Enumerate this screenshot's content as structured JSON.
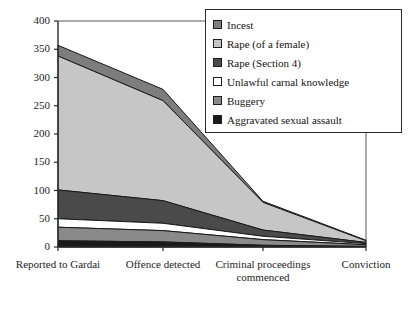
{
  "chart_data": {
    "type": "area",
    "stacked": true,
    "title": "",
    "xlabel": "",
    "ylabel": "",
    "ylim": [
      0,
      400
    ],
    "yticks": [
      0,
      50,
      100,
      150,
      200,
      250,
      300,
      350,
      400
    ],
    "grid": false,
    "legend_position": "top-right",
    "categories": [
      "Reported to Gardai",
      "Offence detected",
      "Criminal proceedings commenced",
      "Conviction"
    ],
    "series": [
      {
        "name": "Aggravated sexual assault",
        "color": "#1a1a1a",
        "values": [
          11,
          9,
          3,
          1
        ]
      },
      {
        "name": "Buggery",
        "color": "#8a8a8a",
        "values": [
          24,
          20,
          10,
          3
        ]
      },
      {
        "name": "Unlawful carnal knowledge",
        "color": "#ffffff",
        "values": [
          15,
          13,
          6,
          2
        ]
      },
      {
        "name": "Rape (Section 4)",
        "color": "#4a4a4a",
        "values": [
          51,
          40,
          11,
          2
        ]
      },
      {
        "name": "Rape (of a female)",
        "color": "#c6c6c6",
        "values": [
          237,
          177,
          49,
          3
        ]
      },
      {
        "name": "Incest",
        "color": "#7d7d7d",
        "values": [
          19,
          20,
          2,
          1
        ]
      }
    ],
    "totals": [
      357,
      279,
      81,
      12
    ]
  },
  "legend": {
    "items": [
      {
        "label": "Incest",
        "color": "#7d7d7d"
      },
      {
        "label": "Rape (of a female)",
        "color": "#c6c6c6"
      },
      {
        "label": "Rape (Section 4)",
        "color": "#4a4a4a"
      },
      {
        "label": "Unlawful carnal knowledge",
        "color": "#ffffff"
      },
      {
        "label": "Buggery",
        "color": "#8a8a8a"
      },
      {
        "label": "Aggravated sexual assault",
        "color": "#1a1a1a"
      }
    ]
  },
  "axis": {
    "y_tick_labels": [
      "400",
      "350",
      "300",
      "250",
      "200",
      "150",
      "100",
      "50",
      "0"
    ],
    "x_tick_labels": [
      "Reported to Gardai",
      "Offence detected",
      "Criminal proceedings commenced",
      "Conviction"
    ]
  }
}
